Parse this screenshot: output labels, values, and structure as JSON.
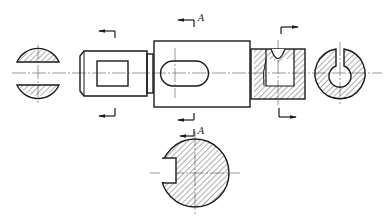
{
  "drawing": {
    "type": "engineering-drawing",
    "subject": "shaft with sectional views",
    "colors": {
      "line": "#1a1a1a",
      "hatch": "#333333",
      "background": "#ffffff"
    },
    "section_labels": {
      "top_a": "A",
      "bottom_a": "A"
    },
    "views": [
      {
        "name": "left-removed-section",
        "shape": "circle with two flats (hatched)"
      },
      {
        "name": "main-view",
        "shape": "stepped shaft with square, slot and partial section"
      },
      {
        "name": "right-removed-section",
        "shape": "C-shaped ring section (hatched)"
      },
      {
        "name": "section-a-a",
        "shape": "circle with keyway (hatched)"
      }
    ]
  }
}
